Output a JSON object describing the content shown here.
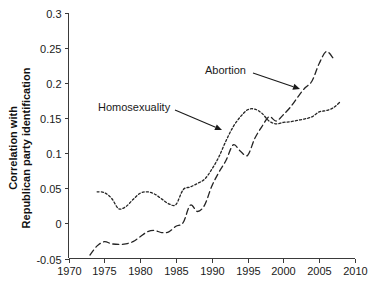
{
  "chart_data": {
    "type": "line",
    "title": "",
    "subtitle": "",
    "xlabel": "",
    "ylabel": "Correlation with Republican party identification",
    "ylabel_line1": "Correlation with",
    "ylabel_line2": "Republican party identification",
    "xlim": [
      1970,
      2010
    ],
    "ylim": [
      -0.05,
      0.3
    ],
    "xticks": [
      1970,
      1975,
      1980,
      1985,
      1990,
      1995,
      2000,
      2005,
      2010
    ],
    "xtick_labels": [
      "1970",
      "1975",
      "1980",
      "1985",
      "1990",
      "1995",
      "2000",
      "2005",
      "2010"
    ],
    "yticks": [
      -0.05,
      0,
      0.05,
      0.1,
      0.15,
      0.2,
      0.25,
      0.3
    ],
    "ytick_labels": [
      "-0.05",
      "0",
      "0.05",
      "0.1",
      "0.15",
      "0.2",
      "0.25",
      "0.3"
    ],
    "grid": false,
    "legend_position": "inline-annotations",
    "line_color": "#242424",
    "series": [
      {
        "name": "Homosexuality",
        "style": "dotted",
        "annotation_label": "Homosexuality",
        "x": [
          1974,
          1975,
          1976,
          1977,
          1978,
          1979,
          1980,
          1981,
          1982,
          1983,
          1984,
          1985,
          1986,
          1987,
          1988,
          1989,
          1990,
          1991,
          1992,
          1993,
          1994,
          1995,
          1996,
          1997,
          1998,
          1999,
          2000,
          2001,
          2002,
          2003,
          2004,
          2005,
          2006,
          2007,
          2008
        ],
        "values": [
          0.045,
          0.044,
          0.036,
          0.021,
          0.024,
          0.034,
          0.043,
          0.045,
          0.042,
          0.035,
          0.028,
          0.027,
          0.048,
          0.052,
          0.057,
          0.063,
          0.077,
          0.095,
          0.118,
          0.138,
          0.152,
          0.162,
          0.163,
          0.157,
          0.146,
          0.142,
          0.144,
          0.145,
          0.147,
          0.149,
          0.152,
          0.159,
          0.161,
          0.165,
          0.174
        ]
      },
      {
        "name": "Abortion",
        "style": "dashed",
        "annotation_label": "Abortion",
        "x": [
          1973,
          1974,
          1975,
          1976,
          1977,
          1978,
          1979,
          1980,
          1981,
          1982,
          1983,
          1984,
          1985,
          1986,
          1987,
          1988,
          1989,
          1990,
          1991,
          1992,
          1993,
          1994,
          1995,
          1996,
          1997,
          1998,
          1999,
          2000,
          2001,
          2002,
          2003,
          2004,
          2005,
          2006,
          2007
        ],
        "values": [
          -0.045,
          -0.032,
          -0.026,
          -0.029,
          -0.03,
          -0.029,
          -0.026,
          -0.019,
          -0.012,
          -0.01,
          -0.013,
          -0.012,
          -0.004,
          0.001,
          0.026,
          0.017,
          0.026,
          0.053,
          0.073,
          0.09,
          0.112,
          0.103,
          0.097,
          0.121,
          0.138,
          0.152,
          0.146,
          0.155,
          0.166,
          0.18,
          0.193,
          0.203,
          0.228,
          0.245,
          0.235
        ]
      }
    ],
    "annotations": [
      {
        "text": "Abortion",
        "text_x": 205,
        "text_y": 74,
        "arrow_from_x": 253,
        "arrow_from_y": 73,
        "arrow_to_x": 300,
        "arrow_to_y": 89
      },
      {
        "text": "Homosexuality",
        "text_x": 98,
        "text_y": 111,
        "arrow_from_x": 175,
        "arrow_from_y": 110,
        "arrow_to_x": 222,
        "arrow_to_y": 130
      }
    ]
  }
}
